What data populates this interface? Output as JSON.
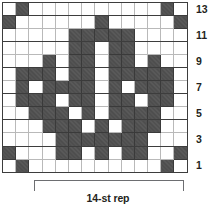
{
  "chart_data": {
    "type": "heatmap",
    "title": "",
    "subtitle": "",
    "xlabel": "",
    "ylabel": "",
    "columns": 14,
    "rows": 13,
    "legend": [],
    "colors": {
      "filled": "#4d4d4d",
      "empty": "#ffffff",
      "gridline": "#b9b9b9",
      "border": "#3d3d3d",
      "text": "#231f20",
      "bracket": "#6d6e71"
    },
    "row_labels": [
      "13",
      "11",
      "9",
      "7",
      "5",
      "3",
      "1"
    ],
    "row_label_rows": [
      13,
      11,
      9,
      7,
      5,
      3,
      1
    ],
    "column_index_start": 1,
    "grid": [
      {
        "row": 13,
        "cells": [
          0,
          1,
          0,
          0,
          0,
          0,
          0,
          0,
          0,
          0,
          0,
          0,
          1,
          0
        ]
      },
      {
        "row": 12,
        "cells": [
          1,
          0,
          0,
          0,
          0,
          0,
          0,
          1,
          0,
          0,
          0,
          0,
          0,
          1
        ]
      },
      {
        "row": 11,
        "cells": [
          0,
          0,
          0,
          0,
          0,
          1,
          1,
          1,
          1,
          1,
          0,
          0,
          0,
          0
        ]
      },
      {
        "row": 10,
        "cells": [
          0,
          0,
          0,
          0,
          0,
          1,
          1,
          0,
          1,
          1,
          0,
          0,
          0,
          0
        ]
      },
      {
        "row": 9,
        "cells": [
          0,
          0,
          0,
          1,
          0,
          1,
          1,
          0,
          1,
          1,
          0,
          1,
          0,
          0
        ]
      },
      {
        "row": 8,
        "cells": [
          0,
          1,
          1,
          1,
          0,
          1,
          1,
          0,
          1,
          1,
          1,
          1,
          1,
          0
        ]
      },
      {
        "row": 7,
        "cells": [
          0,
          1,
          0,
          1,
          1,
          1,
          1,
          0,
          1,
          0,
          1,
          1,
          1,
          0
        ]
      },
      {
        "row": 6,
        "cells": [
          0,
          1,
          1,
          1,
          0,
          1,
          1,
          0,
          1,
          1,
          0,
          1,
          1,
          0
        ]
      },
      {
        "row": 5,
        "cells": [
          0,
          0,
          1,
          1,
          1,
          0,
          1,
          0,
          1,
          1,
          1,
          1,
          0,
          0
        ]
      },
      {
        "row": 4,
        "cells": [
          0,
          0,
          0,
          1,
          1,
          1,
          0,
          1,
          0,
          1,
          1,
          1,
          0,
          0
        ]
      },
      {
        "row": 3,
        "cells": [
          0,
          0,
          0,
          0,
          1,
          1,
          1,
          1,
          1,
          1,
          1,
          0,
          0,
          0
        ]
      },
      {
        "row": 2,
        "cells": [
          1,
          0,
          0,
          0,
          1,
          1,
          0,
          1,
          0,
          1,
          1,
          0,
          0,
          1
        ]
      },
      {
        "row": 1,
        "cells": [
          0,
          1,
          0,
          0,
          0,
          0,
          0,
          0,
          0,
          0,
          0,
          0,
          1,
          0
        ]
      }
    ]
  },
  "repeat": {
    "caption": "14-st rep",
    "stitches": 14
  }
}
